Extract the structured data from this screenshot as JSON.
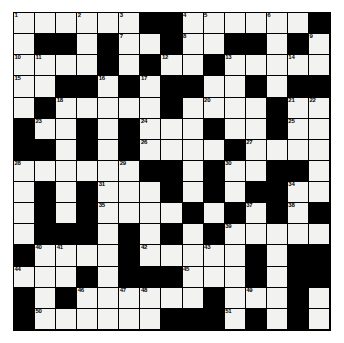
{
  "puzzle": {
    "type": "crossword-grid",
    "title": "Crossword Puzzle Grid",
    "rows": 15,
    "cols": 15,
    "colors": {
      "block": "#000000",
      "open": "#f2f2f0",
      "gridline": "#000000",
      "number": "#000000",
      "page_background": "#ffffff"
    },
    "legend": {
      "0": "open square (white)",
      "1": "blocked square (black)"
    },
    "blocks": [
      [
        0,
        0,
        0,
        0,
        0,
        0,
        1,
        1,
        0,
        0,
        0,
        0,
        0,
        0,
        1
      ],
      [
        0,
        1,
        1,
        0,
        1,
        0,
        0,
        1,
        0,
        0,
        1,
        1,
        0,
        1,
        0
      ],
      [
        0,
        0,
        0,
        0,
        1,
        0,
        1,
        0,
        0,
        1,
        0,
        0,
        0,
        0,
        0
      ],
      [
        0,
        0,
        1,
        1,
        0,
        1,
        0,
        1,
        1,
        0,
        0,
        1,
        0,
        1,
        1
      ],
      [
        0,
        1,
        0,
        0,
        0,
        0,
        0,
        1,
        0,
        0,
        0,
        0,
        1,
        0,
        0
      ],
      [
        1,
        0,
        0,
        1,
        0,
        1,
        0,
        0,
        0,
        1,
        0,
        0,
        1,
        0,
        0
      ],
      [
        1,
        1,
        0,
        1,
        0,
        1,
        0,
        0,
        0,
        0,
        1,
        0,
        0,
        0,
        0
      ],
      [
        0,
        0,
        0,
        0,
        0,
        0,
        1,
        1,
        0,
        1,
        0,
        0,
        1,
        1,
        0
      ],
      [
        0,
        1,
        0,
        1,
        0,
        0,
        0,
        1,
        0,
        1,
        0,
        1,
        1,
        0,
        0
      ],
      [
        0,
        1,
        0,
        1,
        0,
        0,
        0,
        0,
        1,
        0,
        1,
        0,
        1,
        0,
        1
      ],
      [
        0,
        1,
        1,
        1,
        0,
        1,
        0,
        1,
        0,
        1,
        0,
        0,
        0,
        0,
        0
      ],
      [
        1,
        0,
        0,
        0,
        0,
        1,
        0,
        0,
        0,
        0,
        0,
        1,
        0,
        1,
        1
      ],
      [
        0,
        0,
        0,
        1,
        0,
        1,
        1,
        1,
        0,
        0,
        0,
        1,
        0,
        1,
        1
      ],
      [
        1,
        0,
        1,
        0,
        0,
        0,
        0,
        0,
        0,
        1,
        0,
        0,
        0,
        1,
        0
      ],
      [
        1,
        0,
        0,
        0,
        0,
        0,
        0,
        1,
        1,
        1,
        0,
        1,
        0,
        1,
        0
      ]
    ],
    "numbers": [
      {
        "n": 1,
        "row": 1,
        "col": 1
      },
      {
        "n": 2,
        "row": 1,
        "col": 4
      },
      {
        "n": 3,
        "row": 1,
        "col": 6
      },
      {
        "n": 4,
        "row": 1,
        "col": 9
      },
      {
        "n": 5,
        "row": 1,
        "col": 10
      },
      {
        "n": 6,
        "row": 1,
        "col": 13
      },
      {
        "n": 7,
        "row": 2,
        "col": 6
      },
      {
        "n": 8,
        "row": 2,
        "col": 9
      },
      {
        "n": 9,
        "row": 2,
        "col": 15
      },
      {
        "n": 10,
        "row": 3,
        "col": 1
      },
      {
        "n": 11,
        "row": 3,
        "col": 2
      },
      {
        "n": 12,
        "row": 3,
        "col": 8
      },
      {
        "n": 13,
        "row": 3,
        "col": 11
      },
      {
        "n": 14,
        "row": 3,
        "col": 14
      },
      {
        "n": 15,
        "row": 4,
        "col": 1
      },
      {
        "n": 16,
        "row": 4,
        "col": 5
      },
      {
        "n": 17,
        "row": 4,
        "col": 7
      },
      {
        "n": 18,
        "row": 5,
        "col": 3
      },
      {
        "n": 19,
        "row": 5,
        "col": 8
      },
      {
        "n": 20,
        "row": 5,
        "col": 10
      },
      {
        "n": 21,
        "row": 5,
        "col": 14
      },
      {
        "n": 22,
        "row": 5,
        "col": 15
      },
      {
        "n": 23,
        "row": 6,
        "col": 2
      },
      {
        "n": 24,
        "row": 6,
        "col": 7
      },
      {
        "n": 25,
        "row": 6,
        "col": 14
      },
      {
        "n": 26,
        "row": 7,
        "col": 7
      },
      {
        "n": 27,
        "row": 7,
        "col": 12
      },
      {
        "n": 28,
        "row": 8,
        "col": 1
      },
      {
        "n": 29,
        "row": 8,
        "col": 6
      },
      {
        "n": 30,
        "row": 8,
        "col": 11
      },
      {
        "n": 31,
        "row": 9,
        "col": 5
      },
      {
        "n": 32,
        "row": 9,
        "col": 8
      },
      {
        "n": 33,
        "row": 9,
        "col": 10
      },
      {
        "n": 34,
        "row": 9,
        "col": 14
      },
      {
        "n": 35,
        "row": 10,
        "col": 5
      },
      {
        "n": 36,
        "row": 10,
        "col": 9
      },
      {
        "n": 37,
        "row": 10,
        "col": 12
      },
      {
        "n": 38,
        "row": 10,
        "col": 14
      },
      {
        "n": 39,
        "row": 11,
        "col": 11
      },
      {
        "n": 40,
        "row": 12,
        "col": 2
      },
      {
        "n": 41,
        "row": 12,
        "col": 3
      },
      {
        "n": 42,
        "row": 12,
        "col": 7
      },
      {
        "n": 43,
        "row": 12,
        "col": 10
      },
      {
        "n": 44,
        "row": 13,
        "col": 1
      },
      {
        "n": 45,
        "row": 13,
        "col": 9
      },
      {
        "n": 46,
        "row": 14,
        "col": 4
      },
      {
        "n": 47,
        "row": 14,
        "col": 6
      },
      {
        "n": 48,
        "row": 14,
        "col": 7
      },
      {
        "n": 49,
        "row": 14,
        "col": 12
      },
      {
        "n": 50,
        "row": 15,
        "col": 2
      },
      {
        "n": 51,
        "row": 15,
        "col": 11
      },
      {
        "n": 52,
        "row": 16,
        "col": 1
      },
      {
        "n": 53,
        "row": 16,
        "col": 7
      }
    ]
  }
}
